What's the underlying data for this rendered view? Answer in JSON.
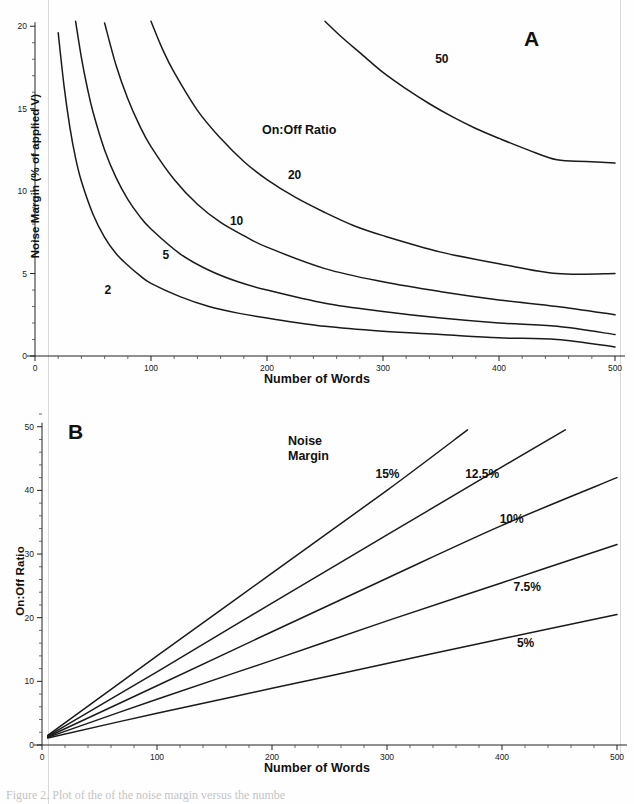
{
  "figure": {
    "caption_partial": "Figure 2. Plot of the of the noise margin versus the numbe",
    "panels": [
      {
        "id": "A",
        "label": "A",
        "legend_title": "On:Off Ratio",
        "axes": {
          "xlabel": "Number of Words",
          "ylabel": "Noise Margin (% of applied V)",
          "xticks": [
            0,
            100,
            200,
            300,
            400,
            500
          ],
          "yticks": [
            0,
            5,
            10,
            15,
            20
          ],
          "xlim": [
            0,
            500
          ],
          "ylim": [
            0,
            20.5
          ]
        }
      },
      {
        "id": "B",
        "label": "B",
        "legend_title": "Noise\nMargin",
        "axes": {
          "xlabel": "Number of Words",
          "ylabel": "On:Off Ratio",
          "xticks": [
            0,
            100,
            200,
            300,
            400,
            500
          ],
          "yticks": [
            0,
            10,
            20,
            30,
            40,
            50
          ],
          "xlim": [
            0,
            500
          ],
          "ylim": [
            0,
            52
          ]
        }
      }
    ]
  },
  "chart_data": [
    {
      "type": "line",
      "panel": "A",
      "title": "",
      "legend_title": "On:Off Ratio",
      "xlabel": "Number of Words",
      "ylabel": "Noise Margin (% of applied V)",
      "xlim": [
        0,
        500
      ],
      "ylim": [
        0,
        20.5
      ],
      "xticks": [
        0,
        100,
        200,
        300,
        400,
        500
      ],
      "yticks": [
        0,
        5,
        10,
        15,
        20
      ],
      "grid": false,
      "legend_position": "inline-curve-labels",
      "series": [
        {
          "name": "2",
          "label": "2",
          "label_xy": [
            60,
            4.0
          ],
          "x": [
            20,
            25,
            30,
            35,
            40,
            50,
            60,
            70,
            80,
            90,
            100,
            125,
            150,
            175,
            200,
            250,
            300,
            350,
            400,
            450,
            500
          ],
          "y": [
            19.6,
            16.4,
            13.9,
            12.0,
            10.6,
            8.6,
            7.2,
            6.2,
            5.5,
            4.9,
            4.4,
            3.6,
            3.0,
            2.6,
            2.3,
            1.8,
            1.5,
            1.3,
            1.1,
            1.0,
            0.55
          ]
        },
        {
          "name": "5",
          "label": "5",
          "label_xy": [
            110,
            6.1
          ],
          "x": [
            35,
            40,
            45,
            50,
            60,
            70,
            80,
            90,
            100,
            125,
            150,
            175,
            200,
            250,
            300,
            350,
            400,
            450,
            500
          ],
          "y": [
            20.3,
            18.1,
            16.3,
            14.8,
            12.5,
            10.8,
            9.5,
            8.5,
            7.7,
            6.2,
            5.2,
            4.5,
            4.0,
            3.2,
            2.7,
            2.3,
            2.0,
            1.8,
            1.3
          ]
        },
        {
          "name": "10",
          "label": "10",
          "label_xy": [
            168,
            8.2
          ],
          "x": [
            60,
            70,
            80,
            90,
            100,
            120,
            140,
            160,
            180,
            200,
            250,
            300,
            350,
            400,
            450,
            500
          ],
          "y": [
            20.2,
            17.6,
            15.6,
            14.0,
            12.7,
            10.7,
            9.2,
            8.1,
            7.3,
            6.6,
            5.3,
            4.5,
            3.9,
            3.4,
            3.0,
            2.5
          ]
        },
        {
          "name": "20",
          "label": "20",
          "label_xy": [
            218,
            11.0
          ],
          "x": [
            100,
            110,
            120,
            140,
            160,
            180,
            200,
            225,
            250,
            275,
            300,
            350,
            400,
            450,
            500
          ],
          "y": [
            20.3,
            18.6,
            17.2,
            14.9,
            13.2,
            11.8,
            10.7,
            9.6,
            8.7,
            7.9,
            7.3,
            6.3,
            5.6,
            5.0,
            5.0
          ]
        },
        {
          "name": "50",
          "label": "50",
          "label_xy": [
            345,
            18.0
          ],
          "x": [
            250,
            265,
            280,
            300,
            320,
            340,
            360,
            380,
            400,
            425,
            450,
            475,
            500
          ],
          "y": [
            20.3,
            19.3,
            18.4,
            17.2,
            16.2,
            15.3,
            14.5,
            13.8,
            13.2,
            12.5,
            11.9,
            11.8,
            11.7
          ]
        }
      ]
    },
    {
      "type": "line",
      "panel": "B",
      "title": "",
      "legend_title": "Noise Margin",
      "xlabel": "Number of Words",
      "ylabel": "On:Off Ratio",
      "xlim": [
        0,
        500
      ],
      "ylim": [
        0,
        52
      ],
      "xticks": [
        0,
        100,
        200,
        300,
        400,
        500
      ],
      "yticks": [
        0,
        10,
        20,
        30,
        40,
        50
      ],
      "grid": false,
      "legend_position": "inline-curve-labels",
      "series": [
        {
          "name": "15%",
          "label": "15%",
          "label_xy": [
            290,
            42.5
          ],
          "x": [
            5,
            100,
            200,
            300,
            370
          ],
          "y": [
            1.5,
            14.0,
            27.0,
            40.0,
            49.5
          ]
        },
        {
          "name": "12.5%",
          "label": "12.5%",
          "label_xy": [
            368,
            42.5
          ],
          "x": [
            5,
            100,
            200,
            300,
            400,
            455
          ],
          "y": [
            1.4,
            11.5,
            22.3,
            33.0,
            43.7,
            49.5
          ]
        },
        {
          "name": "10%",
          "label": "10%",
          "label_xy": [
            398,
            35.5
          ],
          "x": [
            5,
            100,
            200,
            300,
            400,
            500
          ],
          "y": [
            1.3,
            9.3,
            17.8,
            26.2,
            34.5,
            42.0
          ]
        },
        {
          "name": "7.5%",
          "label": "7.5%",
          "label_xy": [
            410,
            24.8
          ],
          "x": [
            5,
            100,
            200,
            300,
            400,
            500
          ],
          "y": [
            1.2,
            7.2,
            13.3,
            19.5,
            25.5,
            31.5
          ]
        },
        {
          "name": "5%",
          "label": "5%",
          "label_xy": [
            413,
            16.0
          ],
          "x": [
            5,
            100,
            200,
            300,
            400,
            500
          ],
          "y": [
            1.1,
            5.0,
            8.9,
            12.8,
            16.7,
            20.5
          ]
        }
      ]
    }
  ]
}
